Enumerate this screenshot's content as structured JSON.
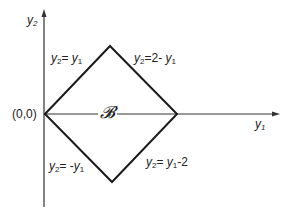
{
  "diagram": {
    "type": "region-diagram",
    "axes": {
      "x_label": {
        "var": "y",
        "sub": "1"
      },
      "y_label": {
        "var": "y",
        "sub": "2"
      },
      "origin_label": "(0,0)"
    },
    "region_label": "𝓑",
    "vertices": [
      {
        "name": "origin",
        "coords": [
          0,
          0
        ]
      },
      {
        "name": "top",
        "coords": [
          1,
          1
        ]
      },
      {
        "name": "right",
        "coords": [
          2,
          0
        ]
      },
      {
        "name": "bottom",
        "coords": [
          1,
          -1
        ]
      }
    ],
    "edges": [
      {
        "id": "upper-left",
        "lhs_var": "y",
        "lhs_sub": "2",
        "rhs_pre": "",
        "rhs_var": "y",
        "rhs_sub": "1",
        "rhs_post": ""
      },
      {
        "id": "upper-right",
        "lhs_var": "y",
        "lhs_sub": "2",
        "rhs_pre": "2- ",
        "rhs_var": "y",
        "rhs_sub": "1",
        "rhs_post": ""
      },
      {
        "id": "lower-left",
        "lhs_var": "y",
        "lhs_sub": "2",
        "rhs_pre": "-",
        "rhs_var": "y",
        "rhs_sub": "1",
        "rhs_post": ""
      },
      {
        "id": "lower-right",
        "lhs_var": "y",
        "lhs_sub": "2",
        "rhs_pre": "",
        "rhs_var": "y",
        "rhs_sub": "1",
        "rhs_post": "-2"
      }
    ],
    "colors": {
      "line": "#1a1a1a",
      "axis": "#333333",
      "background": "#ffffff"
    }
  }
}
